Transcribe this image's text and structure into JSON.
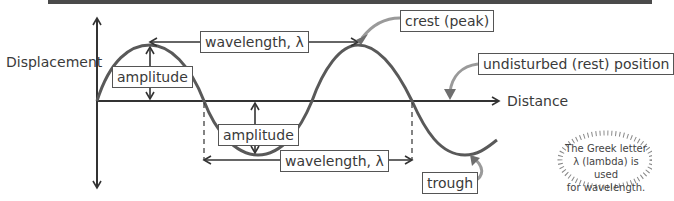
{
  "axes": {
    "y_label": "Displacement",
    "x_label": "Distance"
  },
  "labels": {
    "wavelength_top": "wavelength, λ",
    "wavelength_bottom": "wavelength, λ",
    "amplitude_top": "amplitude",
    "amplitude_bottom": "amplitude",
    "crest": "crest (peak)",
    "rest_position": "undisturbed (rest) position",
    "trough": "trough"
  },
  "note": {
    "line1": "The Greek letter",
    "line2": "λ (lambda) is used",
    "line3": "for wavelength."
  },
  "colors": {
    "wave": "#595959",
    "axis": "#333333",
    "callout_arrow": "#9a9a9a"
  }
}
